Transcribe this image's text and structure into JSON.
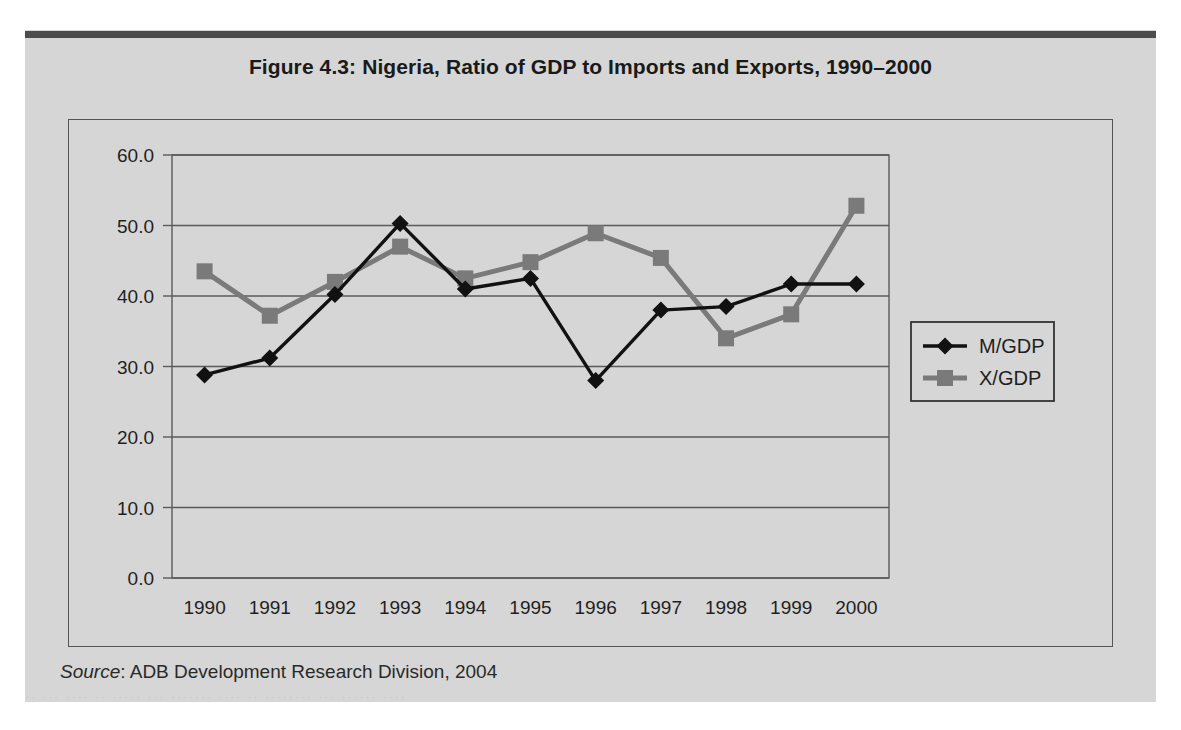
{
  "figure": {
    "title": "Figure 4.3:  Nigeria, Ratio of GDP to Imports and Exports, 1990–2000",
    "source_label": "Source",
    "source_text": ":  ADB Development Research Division, 2004",
    "ghost_text": "·· ··· ···· ·· ····· ··· ······· ···· ·· ········ ··· ······ ····"
  },
  "colors": {
    "page_background": "#ffffff",
    "scan_background": "#d6d6d6",
    "top_rule": "#4c4c4c",
    "frame_border": "#555555",
    "gridline": "#5a5a5a",
    "series_m_gdp": "#111111",
    "series_x_gdp": "#7a7a7a",
    "text": "#1f1f1f"
  },
  "chart_data": {
    "type": "line",
    "title": "Figure 4.3:  Nigeria, Ratio of GDP to Imports and Exports, 1990–2000",
    "xlabel": "",
    "ylabel": "",
    "categories": [
      "1990",
      "1991",
      "1992",
      "1993",
      "1994",
      "1995",
      "1996",
      "1997",
      "1998",
      "1999",
      "2000"
    ],
    "x": [
      1990,
      1991,
      1992,
      1993,
      1994,
      1995,
      1996,
      1997,
      1998,
      1999,
      2000
    ],
    "series": [
      {
        "name": "M/GDP",
        "marker": "diamond",
        "color": "#111111",
        "values": [
          28.8,
          31.2,
          40.2,
          50.3,
          41.0,
          42.5,
          28.0,
          38.0,
          38.5,
          41.7,
          41.7
        ]
      },
      {
        "name": "X/GDP",
        "marker": "square",
        "color": "#7a7a7a",
        "values": [
          43.5,
          37.2,
          42.0,
          47.0,
          42.5,
          44.8,
          48.9,
          45.4,
          34.0,
          37.4,
          52.8
        ]
      }
    ],
    "ylim": [
      0.0,
      60.0
    ],
    "ytick_step": 10.0,
    "ytick_labels": [
      "60.0",
      "50.0",
      "40.0",
      "30.0",
      "20.0",
      "10.0",
      "0.0"
    ],
    "ytick_values": [
      60.0,
      50.0,
      40.0,
      30.0,
      20.0,
      10.0,
      0.0
    ],
    "grid": true,
    "grid_axis": "y",
    "legend_position": "right-middle",
    "legend_entries": [
      "M/GDP",
      "X/GDP"
    ]
  }
}
